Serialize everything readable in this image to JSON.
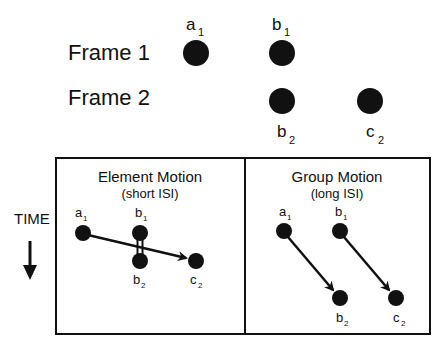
{
  "top": {
    "frame1_label": "Frame 1",
    "frame2_label": "Frame 2",
    "labels": {
      "a": "a",
      "a_sub": "1",
      "b1": "b",
      "b1_sub": "1",
      "b2": "b",
      "b2_sub": "2",
      "c2": "c",
      "c2_sub": "2"
    }
  },
  "time_label": "TIME",
  "panels": [
    {
      "title": "Element Motion",
      "subtitle": "(short ISI)",
      "labels": {
        "a1": "a",
        "a1_sub": "1",
        "b1": "b",
        "b1_sub": "1",
        "b2": "b",
        "b2_sub": "2",
        "c2": "c",
        "c2_sub": "2"
      }
    },
    {
      "title": "Group Motion",
      "subtitle": "(long ISI)",
      "labels": {
        "a1": "a",
        "a1_sub": "1",
        "b1": "b",
        "b1_sub": "1",
        "b2": "b",
        "b2_sub": "2",
        "c2": "c",
        "c2_sub": "2"
      }
    }
  ],
  "colors": {
    "ink": "#111111",
    "background": "#ffffff"
  }
}
